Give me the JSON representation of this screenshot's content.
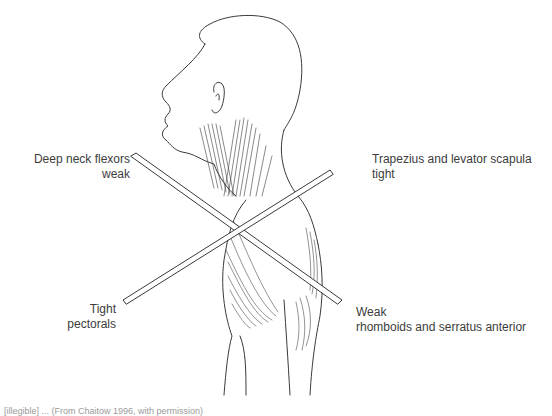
{
  "figure": {
    "labels": {
      "top_left": {
        "line1": "Deep neck flexors",
        "line2": "weak"
      },
      "top_right": {
        "line1": "Trapezius and levator scapula",
        "line2": "tight"
      },
      "bottom_left": {
        "line1": "Tight",
        "line2": "pectorals"
      },
      "bottom_right": {
        "line1": "Weak",
        "line2": "rhomboids and serratus anterior"
      }
    },
    "caption": "[illegible] ... (From Chaitow 1996, with permission)",
    "colors": {
      "line": "#3a3a3a",
      "text": "#3c3c3c",
      "background": "#ffffff"
    }
  }
}
